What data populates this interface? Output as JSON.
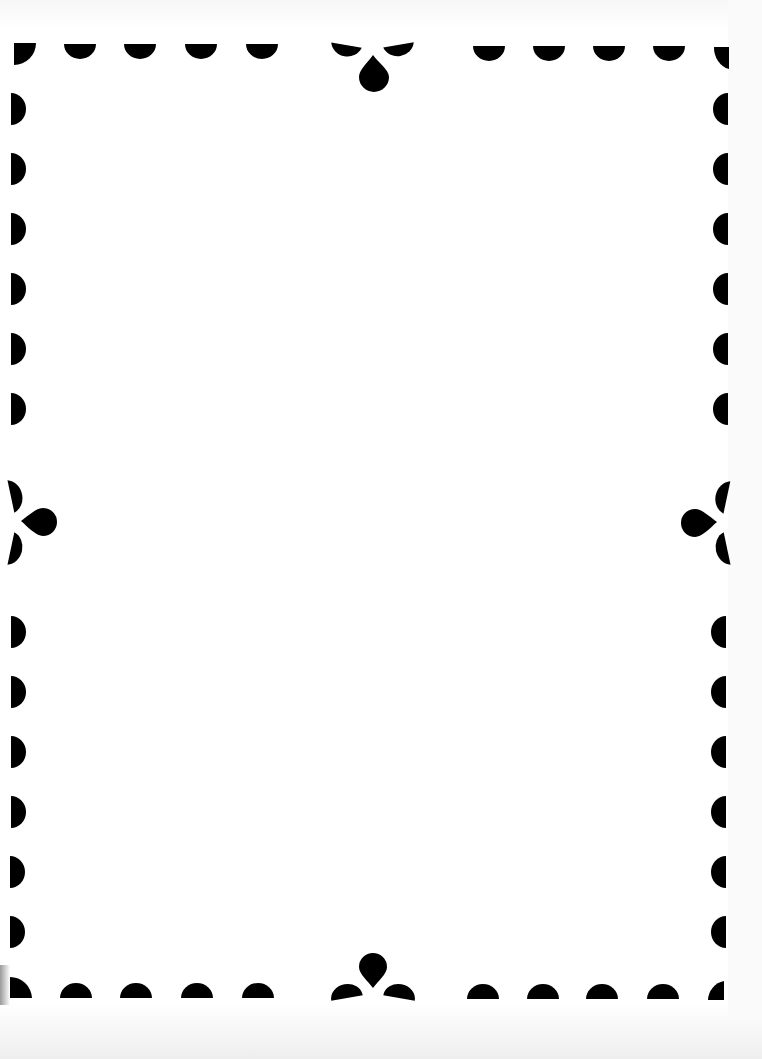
{
  "page": {
    "type": "printable-border-frame",
    "background_color": "#ffffff",
    "ink_color": "#000000",
    "body_text": ""
  },
  "border": {
    "style": "scalloped-semicircle-dots",
    "ornaments": [
      {
        "position": "top-center",
        "icon": "teardrop-icon"
      },
      {
        "position": "bottom-center",
        "icon": "teardrop-icon"
      },
      {
        "position": "left-middle",
        "icon": "teardrop-icon"
      },
      {
        "position": "right-middle",
        "icon": "teardrop-icon"
      }
    ],
    "top_dots_x": [
      90,
      150,
      210,
      270,
      490,
      550,
      610,
      670
    ],
    "bottom_dots_x": [
      93,
      153,
      213,
      273,
      483,
      543,
      603,
      663
    ],
    "left_dots_y": [
      109,
      169,
      229,
      289,
      349,
      409,
      632,
      692,
      752,
      812,
      872,
      932
    ],
    "right_dots_y": [
      109,
      169,
      229,
      289,
      349,
      409,
      632,
      692,
      752,
      812,
      872,
      932
    ]
  }
}
